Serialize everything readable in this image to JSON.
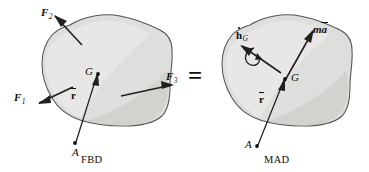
{
  "figure": {
    "equals_sign": "=",
    "colors": {
      "body_fill": "#dededc",
      "body_stroke": "#55534f",
      "ink": "#100e0d",
      "page": "#ffffff"
    }
  },
  "fbd": {
    "caption": "FBD",
    "center_point": "G",
    "reference_point": "A",
    "position_vector": "r",
    "forces": [
      {
        "name": "F",
        "subscript": "1",
        "direction": "down-left"
      },
      {
        "name": "F",
        "subscript": "2",
        "direction": "up-left"
      },
      {
        "name": "F",
        "subscript": "3",
        "direction": "right"
      }
    ]
  },
  "mad": {
    "caption": "MAD",
    "center_point": "G",
    "reference_point": "A",
    "position_vector": "r",
    "angular_momentum_rate": {
      "symbol": "h",
      "subscript": "G",
      "accent": "dot"
    },
    "inertia_force": {
      "mass_symbol": "m",
      "accel_symbol": "a",
      "accent": "bar"
    }
  }
}
